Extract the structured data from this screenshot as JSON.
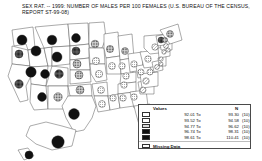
{
  "title": "SEX RAT. -- 1999: NUMBER OF MALES PER 100 FEMALES (U.S. BUREAU OF THE CENSUS, REPORT ST-99-08)",
  "legend": {
    "header_values": "Values",
    "header_n": "N",
    "to_word": "To",
    "missing_label": "Missing Data",
    "classes": [
      {
        "low": "92.01",
        "high": "93.30",
        "count": "(10)",
        "fill": "#ffffff",
        "pattern": "hatch-light"
      },
      {
        "low": "93.52",
        "high": "94.58",
        "count": "(10)",
        "fill": "#d9d9d9",
        "pattern": "dots-light"
      },
      {
        "low": "94.77",
        "high": "96.62",
        "count": "(10)",
        "fill": "#a6a6a6",
        "pattern": "dots-mid"
      },
      {
        "low": "96.74",
        "high": "98.31",
        "count": "(10)",
        "fill": "#595959",
        "pattern": "dots-dark"
      },
      {
        "low": "98.61",
        "high": "110.41",
        "count": "(10)",
        "fill": "#111111",
        "pattern": "solid"
      }
    ]
  },
  "chart_data": {
    "type": "map",
    "title": "SEX RAT. -- 1999: NUMBER OF MALES PER 100 FEMALES (U.S. BUREAU OF THE CENSUS, REPORT ST-99-08)",
    "value_label": "Males per 100 females",
    "symbol": "graduated circle",
    "class_breaks": [
      92.01,
      93.3,
      93.52,
      94.58,
      94.77,
      96.62,
      96.74,
      98.31,
      98.61,
      110.41
    ],
    "class_counts": [
      10,
      10,
      10,
      10,
      10
    ],
    "states": [
      {
        "code": "WA",
        "name": "Washington",
        "class": 5,
        "cx": 22,
        "cy": 26,
        "r": 5.0
      },
      {
        "code": "OR",
        "name": "Oregon",
        "class": 4,
        "cx": 19,
        "cy": 40,
        "r": 4.0
      },
      {
        "code": "CA",
        "name": "California",
        "class": 4,
        "cx": 19,
        "cy": 70,
        "r": 4.2
      },
      {
        "code": "ID",
        "name": "Idaho",
        "class": 5,
        "cx": 36,
        "cy": 37,
        "r": 5.0
      },
      {
        "code": "NV",
        "name": "Nevada",
        "class": 5,
        "cx": 31,
        "cy": 58,
        "r": 5.2
      },
      {
        "code": "UT",
        "name": "Utah",
        "class": 5,
        "cx": 45,
        "cy": 60,
        "r": 4.4
      },
      {
        "code": "AZ",
        "name": "Arizona",
        "class": 5,
        "cx": 42,
        "cy": 83,
        "r": 4.4
      },
      {
        "code": "MT",
        "name": "Montana",
        "class": 5,
        "cx": 52,
        "cy": 26,
        "r": 4.8
      },
      {
        "code": "WY",
        "name": "Wyoming",
        "class": 5,
        "cx": 57,
        "cy": 43,
        "r": 5.0
      },
      {
        "code": "CO",
        "name": "Colorado",
        "class": 4,
        "cx": 59,
        "cy": 60,
        "r": 4.3
      },
      {
        "code": "NM",
        "name": "New Mexico",
        "class": 3,
        "cx": 58,
        "cy": 83,
        "r": 4.2
      },
      {
        "code": "ND",
        "name": "North Dakota",
        "class": 5,
        "cx": 76,
        "cy": 24,
        "r": 4.4
      },
      {
        "code": "SD",
        "name": "South Dakota",
        "class": 4,
        "cx": 76,
        "cy": 37,
        "r": 4.0
      },
      {
        "code": "NE",
        "name": "Nebraska",
        "class": 3,
        "cx": 77,
        "cy": 50,
        "r": 4.0
      },
      {
        "code": "KS",
        "name": "Kansas",
        "class": 3,
        "cx": 79,
        "cy": 61,
        "r": 4.0
      },
      {
        "code": "OK",
        "name": "Oklahoma",
        "class": 3,
        "cx": 80,
        "cy": 76,
        "r": 4.0
      },
      {
        "code": "TX",
        "name": "Texas",
        "class": 5,
        "cx": 74,
        "cy": 100,
        "r": 5.4
      },
      {
        "code": "MN",
        "name": "Minnesota",
        "class": 3,
        "cx": 95,
        "cy": 30,
        "r": 3.8
      },
      {
        "code": "IA",
        "name": "Iowa",
        "class": 2,
        "cx": 96,
        "cy": 47,
        "r": 3.6
      },
      {
        "code": "MO",
        "name": "Missouri",
        "class": 2,
        "cx": 99,
        "cy": 60,
        "r": 3.6
      },
      {
        "code": "AR",
        "name": "Arkansas",
        "class": 2,
        "cx": 101,
        "cy": 76,
        "r": 3.4
      },
      {
        "code": "LA",
        "name": "Louisiana",
        "class": 2,
        "cx": 102,
        "cy": 90,
        "r": 3.4
      },
      {
        "code": "WI",
        "name": "Wisconsin",
        "class": 3,
        "cx": 110,
        "cy": 35,
        "r": 3.6
      },
      {
        "code": "IL",
        "name": "Illinois",
        "class": 2,
        "cx": 112,
        "cy": 52,
        "r": 3.4
      },
      {
        "code": "MS",
        "name": "Mississippi",
        "class": 2,
        "cx": 113,
        "cy": 84,
        "r": 3.2
      },
      {
        "code": "MI",
        "name": "Michigan",
        "class": 3,
        "cx": 125,
        "cy": 37,
        "r": 3.4
      },
      {
        "code": "IN",
        "name": "Indiana",
        "class": 2,
        "cx": 122,
        "cy": 52,
        "r": 3.2
      },
      {
        "code": "KY",
        "name": "Kentucky",
        "class": 2,
        "cx": 126,
        "cy": 62,
        "r": 3.2
      },
      {
        "code": "TN",
        "name": "Tennessee",
        "class": 2,
        "cx": 124,
        "cy": 71,
        "r": 3.2
      },
      {
        "code": "AL",
        "name": "Alabama",
        "class": 2,
        "cx": 123,
        "cy": 84,
        "r": 3.2
      },
      {
        "code": "OH",
        "name": "Ohio",
        "class": 2,
        "cx": 134,
        "cy": 50,
        "r": 3.2
      },
      {
        "code": "WV",
        "name": "West Virginia",
        "class": 2,
        "cx": 141,
        "cy": 58,
        "r": 3.0
      },
      {
        "code": "GA",
        "name": "Georgia",
        "class": 2,
        "cx": 134,
        "cy": 83,
        "r": 3.2
      },
      {
        "code": "FL",
        "name": "Florida",
        "class": 1,
        "cx": 142,
        "cy": 101,
        "r": 3.4
      },
      {
        "code": "SC",
        "name": "South Carolina",
        "class": 1,
        "cx": 143,
        "cy": 76,
        "r": 3.0
      },
      {
        "code": "NC",
        "name": "North Carolina",
        "class": 1,
        "cx": 146,
        "cy": 67,
        "r": 3.2
      },
      {
        "code": "VA",
        "name": "Virginia",
        "class": 2,
        "cx": 150,
        "cy": 58,
        "r": 3.0
      },
      {
        "code": "PA",
        "name": "Pennsylvania",
        "class": 2,
        "cx": 148,
        "cy": 45,
        "r": 3.2
      },
      {
        "code": "NY",
        "name": "New York",
        "class": 1,
        "cx": 155,
        "cy": 33,
        "r": 3.2
      },
      {
        "code": "MD",
        "name": "Maryland",
        "class": 1,
        "cx": 157,
        "cy": 53,
        "r": 2.4
      },
      {
        "code": "DE",
        "name": "Delaware",
        "class": 1,
        "cx": 161,
        "cy": 50,
        "r": 2.0
      },
      {
        "code": "NJ",
        "name": "New Jersey",
        "class": 1,
        "cx": 161,
        "cy": 45,
        "r": 2.2
      },
      {
        "code": "CT",
        "name": "Connecticut",
        "class": 1,
        "cx": 164,
        "cy": 38,
        "r": 2.2
      },
      {
        "code": "RI",
        "name": "Rhode Island",
        "class": 1,
        "cx": 168,
        "cy": 36,
        "r": 2.0
      },
      {
        "code": "MA",
        "name": "Massachusetts",
        "class": 1,
        "cx": 166,
        "cy": 32,
        "r": 2.4
      },
      {
        "code": "VT",
        "name": "Vermont",
        "class": 4,
        "cx": 161,
        "cy": 26,
        "r": 3.0
      },
      {
        "code": "NH",
        "name": "New Hampshire",
        "class": 3,
        "cx": 165,
        "cy": 26,
        "r": 2.6
      },
      {
        "code": "ME",
        "name": "Maine",
        "class": 3,
        "cx": 170,
        "cy": 20,
        "r": 3.4
      },
      {
        "code": "AK",
        "name": "Alaska",
        "class": 5,
        "cx": 58,
        "cy": 128,
        "r": 6.2
      },
      {
        "code": "HI",
        "name": "Hawaii",
        "class": 5,
        "cx": 29,
        "cy": 141,
        "r": 4.0
      }
    ]
  }
}
